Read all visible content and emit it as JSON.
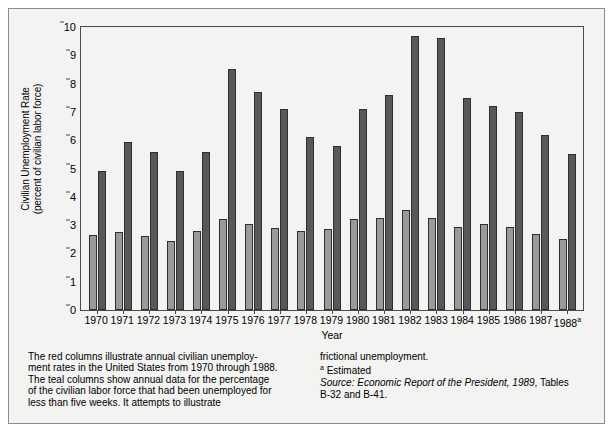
{
  "chart_data": {
    "type": "bar",
    "title": "",
    "xlabel": "Year",
    "ylabel": "Civilian Unemployment Rate (percent of civilian labor force)",
    "ylabel_line1": "Civilian Unemployment Rate",
    "ylabel_line2": "(percent of civilian labor force)",
    "ylim": [
      0,
      10
    ],
    "yticks": [
      0,
      1,
      2,
      3,
      4,
      5,
      6,
      7,
      8,
      9,
      10
    ],
    "grid": false,
    "legend_position": "none",
    "categories": [
      "1970",
      "1971",
      "1972",
      "1973",
      "1974",
      "1975",
      "1976",
      "1977",
      "1978",
      "1979",
      "1980",
      "1981",
      "1982",
      "1983",
      "1984",
      "1985",
      "1986",
      "1987",
      "1988"
    ],
    "category_notes": {
      "1988": "a"
    },
    "series": [
      {
        "name": "Unemployed less than five weeks (percent of civilian labor force)",
        "color": "#9a9a9a",
        "values": [
          2.65,
          2.75,
          2.6,
          2.45,
          2.8,
          3.2,
          3.05,
          2.9,
          2.8,
          2.85,
          3.2,
          3.25,
          3.55,
          3.25,
          2.95,
          3.05,
          2.95,
          2.7,
          2.5
        ]
      },
      {
        "name": "Civilian unemployment rate",
        "color": "#585858",
        "values": [
          4.9,
          5.95,
          5.6,
          4.9,
          5.6,
          8.5,
          7.7,
          7.1,
          6.1,
          5.8,
          7.1,
          7.6,
          9.7,
          9.6,
          7.5,
          7.2,
          7.0,
          6.2,
          5.5
        ]
      }
    ]
  },
  "caption": {
    "left": [
      "The red columns illustrate annual civilian unemploy-",
      "ment rates in the United States from 1970 through 1988.",
      "The teal columns show annual data for the percentage",
      "of the civilian labor force that had been unemployed for",
      "less than five weeks. It attempts to illustrate"
    ],
    "right_line1": "frictional unemployment.",
    "right_footnote_marker": "a",
    "right_footnote_text": " Estimated",
    "right_source_italic": "Source: Economic Report of the President, 1989",
    "right_source_tail": ", Tables",
    "right_source_line2": "B-32 and B-41."
  },
  "colors": {
    "teal_series": "#9a9a9a",
    "red_series": "#585858",
    "axis": "#4a4a4a",
    "frame": "#8d8d8d",
    "background": "#f3f3f1"
  }
}
